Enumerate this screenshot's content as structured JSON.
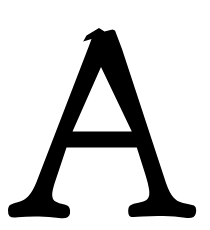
{
  "image": {
    "width": 210,
    "height": 230,
    "background_color": "#ffffff"
  },
  "glyph": {
    "name": "glyph-letter-a",
    "character": "A",
    "description": "Uppercase letter A",
    "script": "Latin",
    "style": "serif",
    "case": "uppercase",
    "fill_color": "#000000",
    "alt_text": "A",
    "bounds": {
      "left": 8,
      "top": 28,
      "right": 196,
      "bottom": 218,
      "width": 188,
      "height": 190
    },
    "parts": [
      {
        "name": "apex",
        "label": "Apex",
        "top_y": 28,
        "left_x": 83,
        "right_x": 115
      },
      {
        "name": "left-diagonal",
        "label": "Left diagonal (thin stroke)",
        "stroke_width": 16
      },
      {
        "name": "right-diagonal",
        "label": "Right diagonal (thick stem)",
        "stroke_width": 30
      },
      {
        "name": "crossbar",
        "label": "Crossbar",
        "top_y": 130,
        "bottom_y": 141,
        "left_x": 58,
        "right_x": 155
      },
      {
        "name": "left-foot-serif",
        "label": "Left foot serif",
        "left_x": 8,
        "right_x": 62,
        "baseline_y": 218
      },
      {
        "name": "right-foot-serif",
        "label": "Right foot serif",
        "left_x": 130,
        "right_x": 196,
        "baseline_y": 218
      },
      {
        "name": "counter",
        "label": "Counter (triangular aperture)"
      }
    ]
  }
}
